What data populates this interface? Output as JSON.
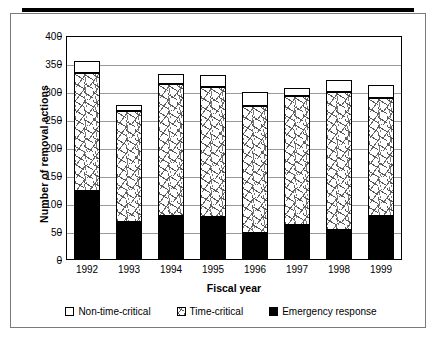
{
  "chart_data": {
    "type": "bar",
    "stacked": true,
    "title": "",
    "xlabel": "Fiscal year",
    "ylabel": "Number of removal actions",
    "categories": [
      "1992",
      "1993",
      "1994",
      "1995",
      "1996",
      "1997",
      "1998",
      "1999"
    ],
    "series": [
      {
        "name": "Emergency response",
        "swatch": "black",
        "values": [
          123,
          68,
          79,
          77,
          48,
          62,
          53,
          79
        ]
      },
      {
        "name": "Time-critical",
        "swatch": "hatch",
        "values": [
          211,
          198,
          235,
          232,
          227,
          231,
          247,
          210
        ]
      },
      {
        "name": "Non-time-critical",
        "swatch": "white",
        "values": [
          21,
          11,
          18,
          22,
          25,
          14,
          21,
          24
        ]
      }
    ],
    "cumulative_tops": {
      "emergency_response": [
        123,
        68,
        79,
        77,
        48,
        62,
        53,
        79
      ],
      "time_critical": [
        334,
        266,
        314,
        309,
        275,
        293,
        300,
        289
      ],
      "total": [
        355,
        277,
        332,
        331,
        300,
        307,
        321,
        313
      ]
    },
    "ylim": [
      0,
      400
    ],
    "ytick_step": 50,
    "yticks": [
      "400",
      "350",
      "300",
      "250",
      "200",
      "150",
      "100",
      "50",
      "0"
    ],
    "ytick_values": [
      400,
      350,
      300,
      250,
      200,
      150,
      100,
      50,
      0
    ],
    "grid": true,
    "grid_axis": "y",
    "legend_position": "bottom",
    "legend": [
      {
        "label": "Non-time-critical",
        "swatch": "white"
      },
      {
        "label": "Time-critical",
        "swatch": "hatch"
      },
      {
        "label": "Emergency response",
        "swatch": "black"
      }
    ]
  },
  "colors": {
    "emergency_response": "#000000",
    "non_time_critical": "#ffffff",
    "grid": "#9a9a9a",
    "axis": "#000000",
    "frame": "#7a7a7a",
    "top_rule": "#000000"
  }
}
